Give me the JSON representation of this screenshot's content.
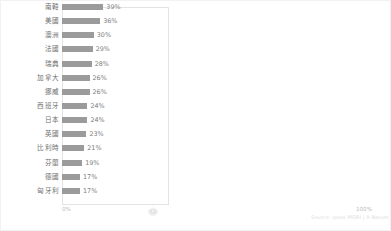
{
  "chart_data": {
    "type": "bar",
    "orientation": "horizontal",
    "title": "",
    "xlabel": "",
    "ylabel": "",
    "xlim": [
      0,
      100
    ],
    "grid": false,
    "legend": null,
    "value_suffix": "%",
    "bar_color": "#9b9b9b",
    "categories": [
      "南韓",
      "美國",
      "澳洲",
      "法國",
      "瑞典",
      "加拿大",
      "挪威",
      "西班牙",
      "日本",
      "英國",
      "比利時",
      "芬蘭",
      "德國",
      "匈牙利"
    ],
    "values": [
      39,
      36,
      30,
      29,
      28,
      26,
      26,
      24,
      24,
      23,
      21,
      19,
      17,
      17
    ],
    "value_labels": [
      "39%",
      "36%",
      "30%",
      "29%",
      "28%",
      "26%",
      "26%",
      "24%",
      "24%",
      "23%",
      "21%",
      "19%",
      "17%",
      "17%"
    ],
    "xtick_labels": [
      "0%",
      "100%"
    ]
  },
  "axis": {
    "min_label": "0%",
    "max_label": "100%"
  },
  "footer": {
    "source": "Source: Ipsos MORI | A Nature"
  },
  "watermark": {
    "icon": "circular-logo-watermark"
  }
}
